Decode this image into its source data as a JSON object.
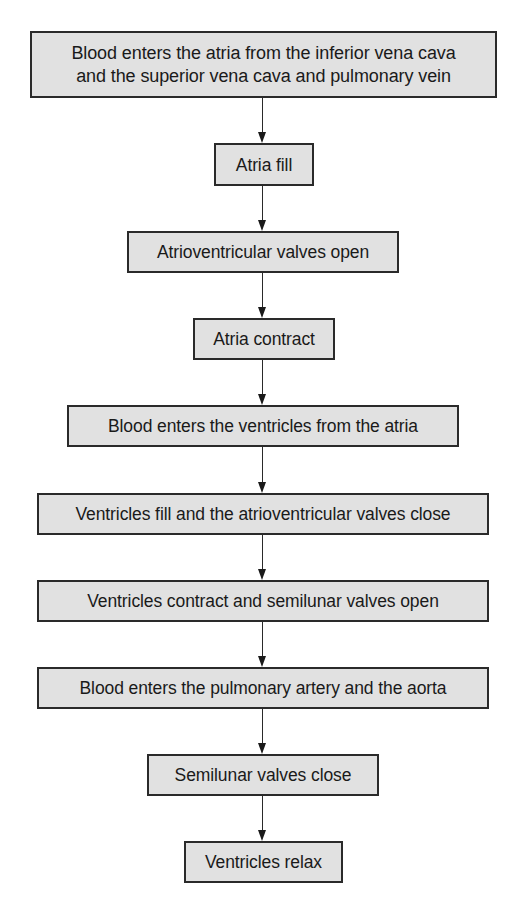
{
  "diagram": {
    "type": "flowchart",
    "direction": "top-to-bottom",
    "colors": {
      "node_fill": "#e1e1e1",
      "node_border": "#2a2a2a",
      "text": "#1a1a1a",
      "arrow": "#2a2a2a",
      "background": "#ffffff"
    },
    "nodes": [
      {
        "id": "n1",
        "label": "Blood enters the atria from the inferior vena cava\nand the superior vena cava and pulmonary vein"
      },
      {
        "id": "n2",
        "label": "Atria fill"
      },
      {
        "id": "n3",
        "label": "Atrioventricular valves open"
      },
      {
        "id": "n4",
        "label": "Atria contract"
      },
      {
        "id": "n5",
        "label": "Blood enters the ventricles from the atria"
      },
      {
        "id": "n6",
        "label": "Ventricles fill and the atrioventricular valves close"
      },
      {
        "id": "n7",
        "label": "Ventricles contract and semilunar valves open"
      },
      {
        "id": "n8",
        "label": "Blood enters the pulmonary artery and the aorta"
      },
      {
        "id": "n9",
        "label": "Semilunar valves close"
      },
      {
        "id": "n10",
        "label": "Ventricles relax"
      }
    ],
    "edges": [
      {
        "from": "n1",
        "to": "n2"
      },
      {
        "from": "n2",
        "to": "n3"
      },
      {
        "from": "n3",
        "to": "n4"
      },
      {
        "from": "n4",
        "to": "n5"
      },
      {
        "from": "n5",
        "to": "n6"
      },
      {
        "from": "n6",
        "to": "n7"
      },
      {
        "from": "n7",
        "to": "n8"
      },
      {
        "from": "n8",
        "to": "n9"
      },
      {
        "from": "n9",
        "to": "n10"
      }
    ]
  }
}
